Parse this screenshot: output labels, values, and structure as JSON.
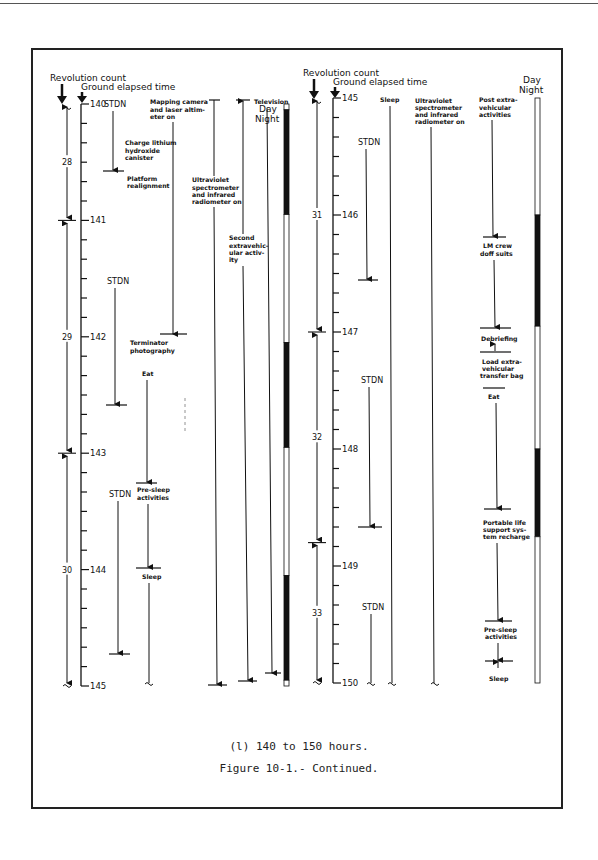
{
  "headers": {
    "revolution_count": "Revolution count",
    "ground_elapsed_time": "Ground elapsed time",
    "day": "Day",
    "night": "Night"
  },
  "left_panel": {
    "get_ticks": [
      "140",
      "141",
      "142",
      "143",
      "144",
      "145"
    ],
    "revolutions": [
      {
        "label": "28",
        "start": 140.0,
        "end": 141.0
      },
      {
        "label": "29",
        "start": 141.0,
        "end": 143.0
      },
      {
        "label": "30",
        "start": 143.0,
        "end": 145.0
      }
    ],
    "activities": {
      "stdn_1": "STDN",
      "charge_lithium": "Charge lithium hydroxide canister",
      "platform_realignment": "Platform realignment",
      "stdn_2": "STDN",
      "mapping_camera": "Mapping camera and laser altimeter on",
      "terminator_photography": "Terminator photography",
      "eat": "Eat",
      "stdn_3": "STDN",
      "pre_sleep": "Pre-sleep activities",
      "sleep": "Sleep",
      "uv_spectrometer": "Ultraviolet spectrometer and infrared radiometer on",
      "second_eva": "Second extravehicular activity",
      "television": "Television"
    },
    "day_night": [
      {
        "state": "day",
        "start": 140.0,
        "end": 140.05
      },
      {
        "state": "night",
        "start": 140.05,
        "end": 140.95
      },
      {
        "state": "day",
        "start": 140.95,
        "end": 142.05
      },
      {
        "state": "night",
        "start": 142.05,
        "end": 142.95
      },
      {
        "state": "day",
        "start": 142.95,
        "end": 144.05
      },
      {
        "state": "night",
        "start": 144.05,
        "end": 144.95
      },
      {
        "state": "day",
        "start": 144.95,
        "end": 145.0
      }
    ]
  },
  "right_panel": {
    "get_ticks": [
      "145",
      "146",
      "147",
      "148",
      "149",
      "150"
    ],
    "revolutions": [
      {
        "label": "31",
        "start": 145.0,
        "end": 147.0
      },
      {
        "label": "32",
        "start": 147.0,
        "end": 148.8
      },
      {
        "label": "33",
        "start": 148.8,
        "end": 150.0
      }
    ],
    "activities": {
      "sleep_top": "Sleep",
      "uv_spectrometer": "Ultraviolet spectrometer and infrared radiometer on",
      "post_eva": "Post extravehicular activities",
      "stdn_1": "STDN",
      "lm_crew": "LM crew doff suits",
      "debriefing": "Debriefing",
      "load_eva_bag": "Load extravehicular transfer bag",
      "eat": "Eat",
      "stdn_2": "STDN",
      "plss_recharge": "Portable life support system recharge",
      "stdn_3": "STDN",
      "pre_sleep": "Pre-sleep activities",
      "sleep": "Sleep"
    },
    "day_night": [
      {
        "state": "day",
        "start": 145.0,
        "end": 146.0
      },
      {
        "state": "night",
        "start": 146.0,
        "end": 146.95
      },
      {
        "state": "day",
        "start": 146.95,
        "end": 148.0
      },
      {
        "state": "night",
        "start": 148.0,
        "end": 148.75
      },
      {
        "state": "day",
        "start": 148.75,
        "end": 150.0
      }
    ]
  },
  "caption": {
    "subtitle": "(l) 140 to 150 hours.",
    "figure": "Figure 10-1.- Continued."
  }
}
